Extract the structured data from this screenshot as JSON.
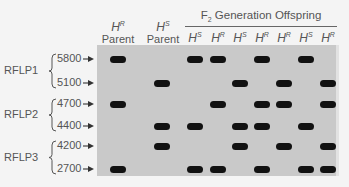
{
  "header": {
    "f2_title_prefix": "F",
    "f2_title_sub": "2",
    "f2_title_suffix": " Generation Offspring",
    "parents": [
      {
        "allele": "H",
        "sup": "R",
        "label": "Parent"
      },
      {
        "allele": "H",
        "sup": "S",
        "label": "Parent"
      }
    ],
    "offspring": [
      {
        "allele": "H",
        "sup": "S"
      },
      {
        "allele": "H",
        "sup": "R"
      },
      {
        "allele": "H",
        "sup": "S"
      },
      {
        "allele": "H",
        "sup": "R"
      },
      {
        "allele": "H",
        "sup": "R"
      },
      {
        "allele": "H",
        "sup": "S"
      },
      {
        "allele": "H",
        "sup": "R"
      }
    ]
  },
  "markers": [
    {
      "group": "RFLP1",
      "sizes": [
        "5800",
        "5100"
      ]
    },
    {
      "group": "RFLP2",
      "sizes": [
        "4700",
        "4400"
      ]
    },
    {
      "group": "RFLP3",
      "sizes": [
        "4200",
        "2700"
      ]
    }
  ],
  "colors": {
    "gel": "#c9c9c9",
    "band": "#111111",
    "text": "#555555"
  },
  "bands": {
    "5800": [
      1,
      3,
      4,
      6,
      8
    ],
    "5100": [
      2,
      5,
      7,
      9
    ],
    "4700": [
      1,
      4,
      6,
      7,
      9
    ],
    "4400": [
      2,
      3,
      5,
      6,
      8
    ],
    "4200": [
      2,
      5,
      7,
      9
    ],
    "2700": [
      1,
      3,
      4,
      6,
      8,
      9
    ]
  }
}
